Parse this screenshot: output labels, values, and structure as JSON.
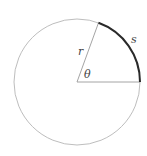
{
  "diagram": {
    "labels": {
      "radius": "r",
      "angle": "θ",
      "arc": "s"
    },
    "geometry": {
      "center": [
        77,
        82
      ],
      "radius": 63,
      "angle_deg": 70
    },
    "colors": {
      "circle": "#b0b0b0",
      "radius_lines": "#9a9a9a",
      "arc": "#2a2a2a",
      "text": "#444444"
    }
  }
}
